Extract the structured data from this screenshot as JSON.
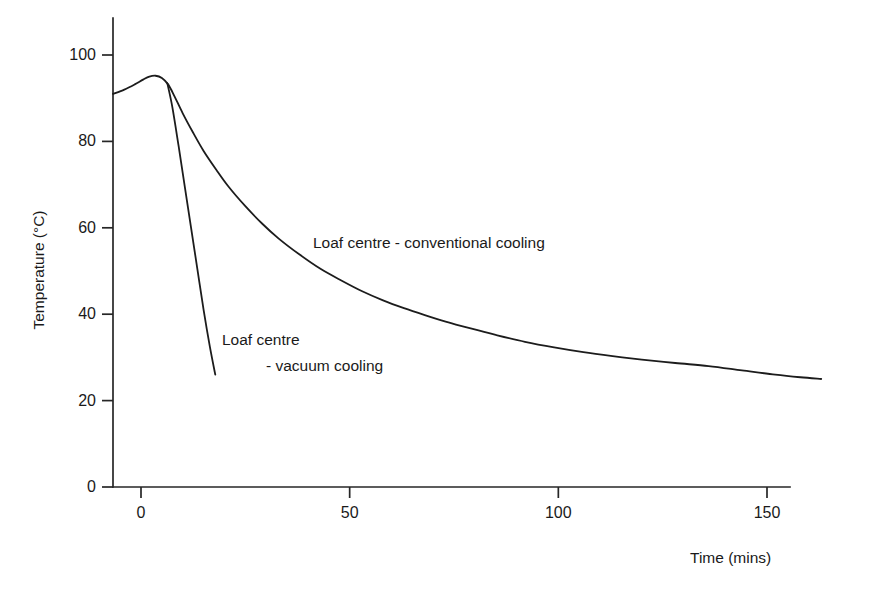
{
  "chart_data": {
    "type": "line",
    "title": "",
    "xlabel": "Time (mins)",
    "ylabel": "Temperature (°C)",
    "xlim": [
      -8,
      168
    ],
    "ylim": [
      0,
      108
    ],
    "xticks": [
      0,
      50,
      100,
      150
    ],
    "xtick_labels": [
      "0",
      "50",
      "100",
      "150"
    ],
    "yticks": [
      0,
      20,
      40,
      60,
      80,
      100
    ],
    "ytick_labels": [
      "0",
      "20",
      "40",
      "60",
      "80",
      "100"
    ],
    "grid": false,
    "legend": "none",
    "annotations": [
      {
        "name": "conventional-cooling-label",
        "text": "Loaf centre - conventional cooling",
        "x": 48,
        "y": 56
      },
      {
        "name": "vacuum-cooling-label-line1",
        "text": "Loaf centre",
        "x": 22,
        "y": 38
      },
      {
        "name": "vacuum-cooling-label-line2",
        "text": "- vacuum cooling",
        "x": 30,
        "y": 32
      }
    ],
    "series": [
      {
        "name": "Loaf centre - conventional cooling",
        "color": "#1c1c1c",
        "points": [
          [
            -6.7,
            91.0
          ],
          [
            -4.0,
            92.0
          ],
          [
            -1.5,
            93.2
          ],
          [
            0.5,
            94.3
          ],
          [
            2.0,
            95.0
          ],
          [
            3.5,
            95.2
          ],
          [
            5.0,
            94.7
          ],
          [
            6.5,
            93.2
          ],
          [
            8.0,
            90.5
          ],
          [
            10.0,
            86.5
          ],
          [
            12.5,
            82.0
          ],
          [
            15.0,
            77.8
          ],
          [
            18.0,
            73.5
          ],
          [
            21.0,
            69.5
          ],
          [
            25.0,
            65.0
          ],
          [
            29.0,
            61.0
          ],
          [
            33.0,
            57.5
          ],
          [
            38.0,
            53.8
          ],
          [
            43.0,
            50.5
          ],
          [
            48.0,
            47.8
          ],
          [
            53.0,
            45.3
          ],
          [
            58.0,
            43.2
          ],
          [
            63.0,
            41.4
          ],
          [
            68.0,
            39.8
          ],
          [
            73.0,
            38.3
          ],
          [
            79.0,
            36.7
          ],
          [
            85.0,
            35.2
          ],
          [
            92.0,
            33.6
          ],
          [
            99.0,
            32.3
          ],
          [
            106.0,
            31.2
          ],
          [
            113.0,
            30.3
          ],
          [
            120.0,
            29.5
          ],
          [
            128.0,
            28.7
          ],
          [
            136.0,
            28.0
          ],
          [
            144.0,
            27.0
          ],
          [
            152.0,
            26.0
          ],
          [
            158.0,
            25.4
          ],
          [
            163.0,
            25.0
          ]
        ]
      },
      {
        "name": "Loaf centre - vacuum cooling",
        "color": "#1c1c1c",
        "points": [
          [
            6.3,
            93.5
          ],
          [
            7.5,
            88.0
          ],
          [
            9.0,
            79.0
          ],
          [
            10.5,
            69.5
          ],
          [
            12.0,
            60.0
          ],
          [
            13.5,
            50.5
          ],
          [
            15.0,
            41.0
          ],
          [
            16.5,
            32.5
          ],
          [
            17.8,
            26.0
          ]
        ]
      }
    ]
  },
  "geometry": {
    "plot_left_px": 113,
    "plot_baseline_px": 487,
    "x0_px": 141,
    "x150_px": 767,
    "y0_px": 487,
    "y100_px": 55,
    "axis_x_end_px": 790,
    "axis_y_top_px": 18
  }
}
